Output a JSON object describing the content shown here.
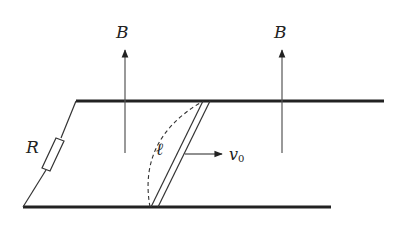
{
  "figure": {
    "labels": {
      "field_left": "B",
      "field_right": "B",
      "resistor": "R",
      "rod_length": "ℓ",
      "velocity": "v",
      "velocity_subscript": "0"
    }
  },
  "colors": {
    "line": "#222222",
    "field_arrow": "#555555",
    "background": "#ffffff"
  }
}
